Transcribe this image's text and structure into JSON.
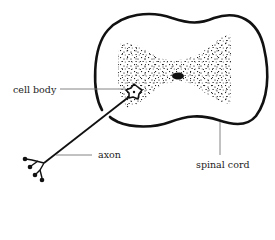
{
  "diagram": {
    "labels": {
      "cell_body": "cell body",
      "axon": "axon",
      "spinal_cord": "spinal cord"
    },
    "elements": [
      {
        "id": "spinal-cord-outline",
        "description": "cross-section outline of spinal cord with gap at lower left"
      },
      {
        "id": "gray-matter",
        "description": "stippled butterfly-shaped gray matter region"
      },
      {
        "id": "central-canal",
        "description": "black oval at center"
      },
      {
        "id": "cell-body",
        "description": "star-shaped neuron cell body in gray matter"
      },
      {
        "id": "axon",
        "description": "long line from cell body exiting spinal cord"
      },
      {
        "id": "axon-terminals",
        "description": "branched endings with dark knobs"
      }
    ],
    "colors": {
      "ink": "#111111",
      "leader_line": "#777777",
      "label_text": "#222222",
      "background": "#ffffff"
    }
  }
}
